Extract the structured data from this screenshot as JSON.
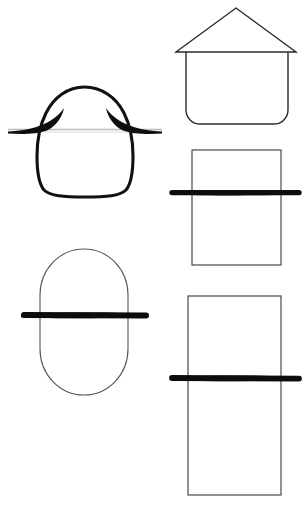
{
  "page": {
    "background_color": "#ffffff",
    "width": 305,
    "height": 505,
    "ink_color": "#111111",
    "light_ink_color": "#b0b0b0",
    "bar_color": "#0d0d0d"
  },
  "figures": [
    {
      "id": "egg-with-wings",
      "name": "egg-shape-with-wing-flares",
      "label": "Egg shape crossed by thin line with tapered black flares",
      "position": "top-left",
      "outline_weight": "thick",
      "crossing_line": {
        "type": "thin-line",
        "color": "#b8b8b8",
        "y": 129,
        "x_start": 8,
        "x_end": 162
      },
      "wings": 2,
      "bounds": {
        "x": 8,
        "y": 86,
        "width": 154,
        "height": 110
      }
    },
    {
      "id": "house",
      "name": "house-shape",
      "label": "House: triangular roof over rounded-bottom square body",
      "position": "top-right",
      "outline_weight": "thin",
      "roof": {
        "apex_x": 236,
        "apex_y": 8,
        "left_x": 176,
        "right_y": 52,
        "right_x": 296
      },
      "body": {
        "x": 186,
        "y": 52,
        "width": 102,
        "height": 72,
        "corner_radius": 14
      },
      "bounds": {
        "x": 176,
        "y": 8,
        "width": 120,
        "height": 116
      }
    },
    {
      "id": "square-with-bar",
      "name": "square-with-horizontal-bar",
      "label": "Square crossed by thick black horizontal bar",
      "position": "middle-right",
      "outline_weight": "thin",
      "rect": {
        "x": 192,
        "y": 150,
        "width": 89,
        "height": 115
      },
      "bar": {
        "x_start": 170,
        "x_end": 301,
        "y": 192,
        "thickness": 6
      },
      "bounds": {
        "x": 170,
        "y": 150,
        "width": 131,
        "height": 115
      }
    },
    {
      "id": "pill-with-bar",
      "name": "rounded-rectangle-with-horizontal-bar",
      "label": "Tall pill / stadium shape crossed by thick black horizontal bar",
      "position": "bottom-left",
      "outline_weight": "thin",
      "pill": {
        "x": 40,
        "y": 249,
        "width": 88,
        "height": 146,
        "corner_radius": 44
      },
      "bar": {
        "x_start": 21,
        "x_end": 149,
        "y": 315,
        "thickness": 6
      },
      "bounds": {
        "x": 21,
        "y": 249,
        "width": 128,
        "height": 146
      }
    },
    {
      "id": "tall-rect-with-bar",
      "name": "tall-rectangle-with-horizontal-bar",
      "label": "Tall rectangle crossed by thick black horizontal bar",
      "position": "bottom-right",
      "outline_weight": "thin",
      "rect": {
        "x": 188,
        "y": 296,
        "width": 93,
        "height": 199
      },
      "bar": {
        "x_start": 170,
        "x_end": 301,
        "y": 378,
        "thickness": 6
      },
      "bounds": {
        "x": 170,
        "y": 296,
        "width": 131,
        "height": 199
      }
    }
  ]
}
